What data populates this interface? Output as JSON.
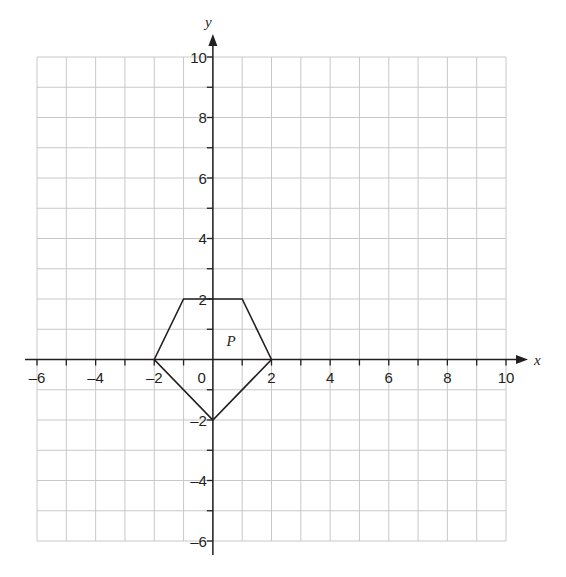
{
  "diagram": {
    "type": "coordinate-grid",
    "x_axis": {
      "label": "x",
      "min": -6,
      "max": 10,
      "tick_labels": [
        "-6",
        "-4",
        "-2",
        "0",
        "2",
        "4",
        "6",
        "8",
        "10"
      ]
    },
    "y_axis": {
      "label": "y",
      "min": -6,
      "max": 10,
      "tick_labels": [
        "-6",
        "-4",
        "-2",
        "2",
        "4",
        "6",
        "8",
        "10"
      ]
    },
    "shape": {
      "label": "P",
      "vertices": [
        [
          -2,
          0
        ],
        [
          -1,
          2
        ],
        [
          1,
          2
        ],
        [
          2,
          0
        ],
        [
          0,
          -2
        ]
      ]
    },
    "colors": {
      "grid": "#c8c8c8",
      "axis": "#231f20",
      "shape": "#231f20",
      "background": "#ffffff"
    }
  },
  "chart_data": {
    "type": "scatter",
    "title": "",
    "xlabel": "x",
    "ylabel": "y",
    "xlim": [
      -6,
      10
    ],
    "ylim": [
      -6,
      10
    ],
    "grid": true,
    "series": [
      {
        "name": "P",
        "kind": "polygon",
        "x": [
          -2,
          -1,
          1,
          2,
          0
        ],
        "y": [
          0,
          2,
          2,
          0,
          -2
        ]
      }
    ],
    "annotations": [
      {
        "text": "P",
        "x": 0.6,
        "y": 0.6
      }
    ]
  }
}
